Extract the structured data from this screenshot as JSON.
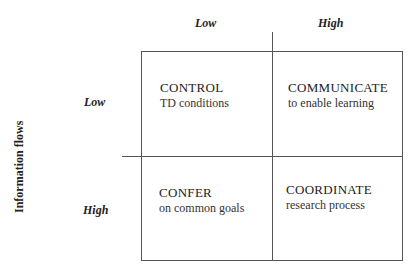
{
  "diagram": {
    "y_axis_label": "Information flows",
    "columns": [
      {
        "label": "Low"
      },
      {
        "label": "High"
      }
    ],
    "rows": [
      {
        "label": "Low"
      },
      {
        "label": "High"
      }
    ],
    "cells": [
      {
        "title": "CONTROL",
        "subtitle": "TD conditions"
      },
      {
        "title": "COMMUNICATE",
        "subtitle": "to enable learning"
      },
      {
        "title": "CONFER",
        "subtitle": "on common goals"
      },
      {
        "title": "COORDINATE",
        "subtitle": "research process"
      }
    ],
    "colors": {
      "line": "#555555",
      "text": "#222222",
      "background": "#ffffff"
    }
  }
}
